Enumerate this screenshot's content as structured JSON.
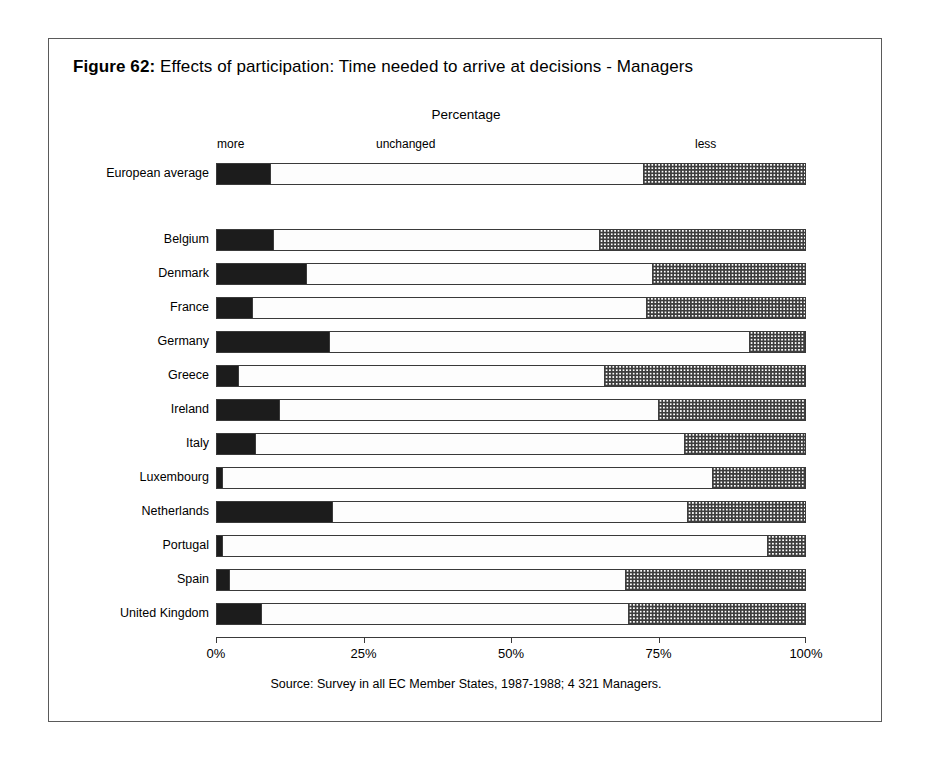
{
  "figure": {
    "number_label": "Figure 62:",
    "title": "Effects of participation: Time needed to arrive at decisions - Managers",
    "axis_title": "Percentage",
    "source": "Source: Survey in all EC Member States, 1987-1988; 4 321 Managers."
  },
  "legend": {
    "more": "more",
    "unchanged": "unchanged",
    "less": "less"
  },
  "axis": {
    "ticks": [
      "0%",
      "25%",
      "50%",
      "75%",
      "100%"
    ]
  },
  "chart_data": {
    "type": "bar",
    "orientation": "horizontal",
    "stacked": true,
    "title": "Effects of participation: Time needed to arrive at decisions - Managers",
    "xlabel": "Percentage",
    "ylabel": "",
    "xlim": [
      0,
      100
    ],
    "xticks": [
      0,
      25,
      50,
      75,
      100
    ],
    "xticklabels": [
      "0%",
      "25%",
      "50%",
      "75%",
      "100%"
    ],
    "grid": false,
    "legend_position": "top",
    "legend": [
      "more",
      "unchanged",
      "less"
    ],
    "categories": [
      "European average",
      "Belgium",
      "Denmark",
      "France",
      "Germany",
      "Greece",
      "Ireland",
      "Italy",
      "Luxembourg",
      "Netherlands",
      "Portugal",
      "Spain",
      "United Kingdom"
    ],
    "series": [
      {
        "name": "more",
        "values": [
          9.0,
          9.5,
          15.0,
          6.0,
          19.0,
          3.5,
          10.5,
          6.5,
          0.8,
          19.5,
          0.8,
          2.0,
          7.5
        ]
      },
      {
        "name": "unchanged",
        "values": [
          63.5,
          55.5,
          59.0,
          67.0,
          71.5,
          62.5,
          64.5,
          73.0,
          83.5,
          60.5,
          92.7,
          67.5,
          62.5
        ]
      },
      {
        "name": "less",
        "values": [
          27.5,
          35.0,
          26.0,
          27.0,
          9.5,
          34.0,
          25.0,
          20.5,
          15.7,
          20.0,
          6.5,
          30.5,
          30.0
        ]
      }
    ],
    "rows": [
      {
        "label": "European average",
        "more": 9.0,
        "unchanged": 63.5,
        "less": 27.5,
        "separated": true
      },
      {
        "label": "Belgium",
        "more": 9.5,
        "unchanged": 55.5,
        "less": 35.0
      },
      {
        "label": "Denmark",
        "more": 15.0,
        "unchanged": 59.0,
        "less": 26.0
      },
      {
        "label": "France",
        "more": 6.0,
        "unchanged": 67.0,
        "less": 27.0
      },
      {
        "label": "Germany",
        "more": 19.0,
        "unchanged": 71.5,
        "less": 9.5
      },
      {
        "label": "Greece",
        "more": 3.5,
        "unchanged": 62.5,
        "less": 34.0
      },
      {
        "label": "Ireland",
        "more": 10.5,
        "unchanged": 64.5,
        "less": 25.0
      },
      {
        "label": "Italy",
        "more": 6.5,
        "unchanged": 73.0,
        "less": 20.5
      },
      {
        "label": "Luxembourg",
        "more": 0.8,
        "unchanged": 83.5,
        "less": 15.7
      },
      {
        "label": "Netherlands",
        "more": 19.5,
        "unchanged": 60.5,
        "less": 20.0
      },
      {
        "label": "Portugal",
        "more": 0.8,
        "unchanged": 92.7,
        "less": 6.5
      },
      {
        "label": "Spain",
        "more": 2.0,
        "unchanged": 67.5,
        "less": 30.5
      },
      {
        "label": "United Kingdom",
        "more": 7.5,
        "unchanged": 62.5,
        "less": 30.0
      }
    ]
  },
  "colors": {
    "more": "#1c1c1c",
    "unchanged": "#fdfdfd",
    "less_pattern": "#3d3d3d",
    "frame": "#5a5a5a",
    "axis": "#3a3a3a"
  }
}
